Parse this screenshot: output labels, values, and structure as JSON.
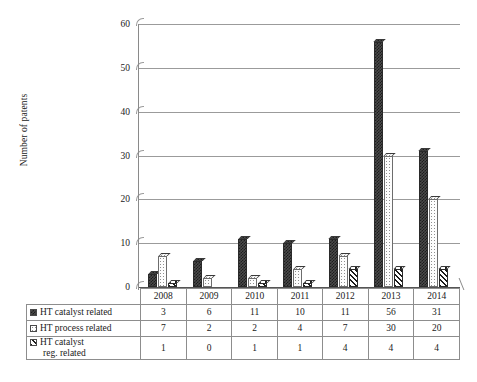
{
  "chart_data": {
    "type": "bar",
    "title": "",
    "xlabel": "",
    "ylabel": "Number of patents",
    "categories": [
      "2008",
      "2009",
      "2010",
      "2011",
      "2012",
      "2013",
      "2014"
    ],
    "series": [
      {
        "name": "HT catalyst related",
        "values": [
          3,
          6,
          11,
          10,
          11,
          56,
          31
        ],
        "pattern": "dark-checker"
      },
      {
        "name": "HT process related",
        "values": [
          7,
          2,
          2,
          4,
          7,
          30,
          20
        ],
        "pattern": "light-dotted"
      },
      {
        "name": "HT catalyst reg. related",
        "values": [
          1,
          0,
          1,
          1,
          4,
          4,
          4
        ],
        "pattern": "diagonal-stripes"
      }
    ],
    "ylim": [
      0,
      60
    ],
    "yticks": [
      0,
      10,
      20,
      30,
      40,
      50,
      60
    ],
    "grid": true,
    "legend_position": "data-table-left",
    "data_table_visible": true
  },
  "axis": {
    "y_title": "Number of patents",
    "y_tick_labels": [
      "60",
      "50",
      "40",
      "30",
      "20",
      "10",
      "0"
    ]
  },
  "table": {
    "year_headers": [
      "2008",
      "2009",
      "2010",
      "2011",
      "2012",
      "2013",
      "2014"
    ],
    "rows": [
      {
        "label": "HT catalyst related",
        "label_line2": "",
        "values": [
          "3",
          "6",
          "11",
          "10",
          "11",
          "56",
          "31"
        ]
      },
      {
        "label": "HT process related",
        "label_line2": "",
        "values": [
          "7",
          "2",
          "2",
          "4",
          "7",
          "30",
          "20"
        ]
      },
      {
        "label": "HT catalyst",
        "label_line2": "reg. related",
        "values": [
          "1",
          "0",
          "1",
          "1",
          "4",
          "4",
          "4"
        ]
      }
    ]
  },
  "colors": {
    "series1": "#2a2a2a",
    "series2": "#fdfdfd",
    "series3": "#1d1d1d",
    "gridline": "#9b9b9b",
    "axis": "#555555",
    "text": "#1a1a1a",
    "background": "#ffffff"
  }
}
